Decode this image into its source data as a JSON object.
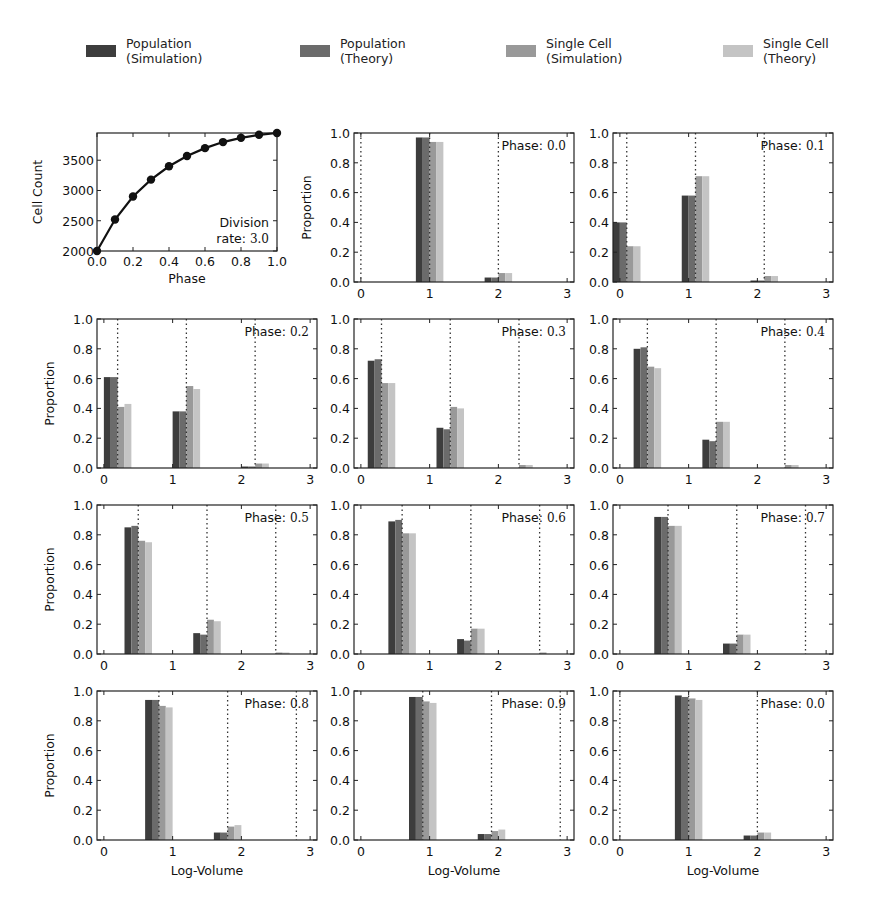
{
  "legend": {
    "items": [
      {
        "label": "Population\n(Simulation)",
        "color": "#3d3d3d"
      },
      {
        "label": "Population\n(Theory)",
        "color": "#6b6b6b"
      },
      {
        "label": "Single Cell\n(Simulation)",
        "color": "#999999"
      },
      {
        "label": "Single Cell\n(Theory)",
        "color": "#c4c4c4"
      }
    ]
  },
  "chart_data": [
    {
      "type": "line",
      "title": "",
      "xlabel": "Phase",
      "ylabel": "Cell Count",
      "xlim": [
        0.0,
        1.0
      ],
      "ylim": [
        2000,
        3950
      ],
      "xticks": [
        "0.0",
        "0.2",
        "0.4",
        "0.6",
        "0.8",
        "1.0"
      ],
      "yticks": [
        "2000",
        "2500",
        "3000",
        "3500"
      ],
      "x": [
        0.0,
        0.1,
        0.2,
        0.3,
        0.4,
        0.5,
        0.6,
        0.7,
        0.8,
        0.9,
        1.0
      ],
      "values": [
        2000,
        2520,
        2900,
        3180,
        3400,
        3570,
        3700,
        3800,
        3870,
        3920,
        3950
      ],
      "annotation": {
        "line1": "Division",
        "line2_prefix": "rate: ",
        "line2_value": "3.0"
      },
      "grid": false
    },
    {
      "type": "bar",
      "panels_description": "Proportion vs Log-Volume for each phase; 4 series per group",
      "xlabel": "Log-Volume",
      "ylabel": "Proportion",
      "xlim": [
        -0.1,
        3.1
      ],
      "ylim": [
        0.0,
        1.0
      ],
      "xticks": [
        "0",
        "1",
        "2",
        "3"
      ],
      "yticks": [
        "0.0",
        "0.2",
        "0.4",
        "0.6",
        "0.8",
        "1.0"
      ],
      "series_names": [
        "Population (Simulation)",
        "Population (Theory)",
        "Single Cell (Simulation)",
        "Single Cell (Theory)"
      ],
      "panels": [
        {
          "phase": "0.0",
          "dotted_lines": [
            0.0,
            1.0,
            2.0
          ],
          "groups": [
            {
              "x": 0.8,
              "values": [
                0.97,
                0.97,
                0.94,
                0.94
              ]
            },
            {
              "x": 1.8,
              "values": [
                0.03,
                0.03,
                0.06,
                0.06
              ]
            }
          ]
        },
        {
          "phase": "0.1",
          "dotted_lines": [
            0.1,
            1.1,
            2.1
          ],
          "groups": [
            {
              "x": -0.1,
              "values": [
                0.4,
                0.4,
                0.24,
                0.24
              ]
            },
            {
              "x": 0.9,
              "values": [
                0.58,
                0.58,
                0.71,
                0.71
              ]
            },
            {
              "x": 1.9,
              "values": [
                0.01,
                0.01,
                0.04,
                0.04
              ]
            }
          ]
        },
        {
          "phase": "0.2",
          "dotted_lines": [
            0.2,
            1.2,
            2.2
          ],
          "groups": [
            {
              "x": 0.0,
              "values": [
                0.61,
                0.61,
                0.41,
                0.43
              ]
            },
            {
              "x": 1.0,
              "values": [
                0.38,
                0.38,
                0.55,
                0.53
              ]
            },
            {
              "x": 2.0,
              "values": [
                0.01,
                0.01,
                0.03,
                0.03
              ]
            }
          ]
        },
        {
          "phase": "0.3",
          "dotted_lines": [
            0.3,
            1.3,
            2.3
          ],
          "groups": [
            {
              "x": 0.1,
              "values": [
                0.72,
                0.73,
                0.57,
                0.57
              ]
            },
            {
              "x": 1.1,
              "values": [
                0.27,
                0.26,
                0.41,
                0.4
              ]
            },
            {
              "x": 2.1,
              "values": [
                0.0,
                0.0,
                0.02,
                0.02
              ]
            }
          ]
        },
        {
          "phase": "0.4",
          "dotted_lines": [
            0.4,
            1.4,
            2.4
          ],
          "groups": [
            {
              "x": 0.2,
              "values": [
                0.8,
                0.81,
                0.68,
                0.67
              ]
            },
            {
              "x": 1.2,
              "values": [
                0.19,
                0.18,
                0.31,
                0.31
              ]
            },
            {
              "x": 2.2,
              "values": [
                0.0,
                0.0,
                0.02,
                0.02
              ]
            }
          ]
        },
        {
          "phase": "0.5",
          "dotted_lines": [
            0.5,
            1.5,
            2.5
          ],
          "groups": [
            {
              "x": 0.3,
              "values": [
                0.85,
                0.86,
                0.76,
                0.75
              ]
            },
            {
              "x": 1.3,
              "values": [
                0.14,
                0.13,
                0.23,
                0.22
              ]
            },
            {
              "x": 2.3,
              "values": [
                0.0,
                0.0,
                0.01,
                0.01
              ]
            }
          ]
        },
        {
          "phase": "0.6",
          "dotted_lines": [
            0.6,
            1.6,
            2.6
          ],
          "groups": [
            {
              "x": 0.4,
              "values": [
                0.89,
                0.9,
                0.81,
                0.81
              ]
            },
            {
              "x": 1.4,
              "values": [
                0.1,
                0.09,
                0.17,
                0.17
              ]
            },
            {
              "x": 2.4,
              "values": [
                0.0,
                0.0,
                0.01,
                0.0
              ]
            }
          ]
        },
        {
          "phase": "0.7",
          "dotted_lines": [
            0.7,
            1.7,
            2.7
          ],
          "groups": [
            {
              "x": 0.5,
              "values": [
                0.92,
                0.92,
                0.86,
                0.86
              ]
            },
            {
              "x": 1.5,
              "values": [
                0.07,
                0.07,
                0.13,
                0.13
              ]
            },
            {
              "x": 2.5,
              "values": [
                0.0,
                0.0,
                0.0,
                0.0
              ]
            }
          ]
        },
        {
          "phase": "0.8",
          "dotted_lines": [
            0.8,
            1.8,
            2.8
          ],
          "groups": [
            {
              "x": 0.6,
              "values": [
                0.94,
                0.94,
                0.9,
                0.89
              ]
            },
            {
              "x": 1.6,
              "values": [
                0.05,
                0.05,
                0.09,
                0.1
              ]
            },
            {
              "x": 2.6,
              "values": [
                0.0,
                0.0,
                0.0,
                0.0
              ]
            }
          ]
        },
        {
          "phase": "0.9",
          "dotted_lines": [
            0.9,
            1.9,
            2.9
          ],
          "groups": [
            {
              "x": 0.7,
              "values": [
                0.96,
                0.96,
                0.93,
                0.92
              ]
            },
            {
              "x": 1.7,
              "values": [
                0.04,
                0.04,
                0.06,
                0.07
              ]
            },
            {
              "x": 2.7,
              "values": [
                0.0,
                0.0,
                0.0,
                0.0
              ]
            }
          ]
        },
        {
          "phase": "0.0",
          "dotted_lines": [
            0.0,
            1.0,
            2.0
          ],
          "groups": [
            {
              "x": 0.8,
              "values": [
                0.97,
                0.96,
                0.95,
                0.94
              ]
            },
            {
              "x": 1.8,
              "values": [
                0.03,
                0.03,
                0.05,
                0.05
              ]
            }
          ]
        }
      ],
      "annotation_prefix": "Phase: "
    }
  ]
}
